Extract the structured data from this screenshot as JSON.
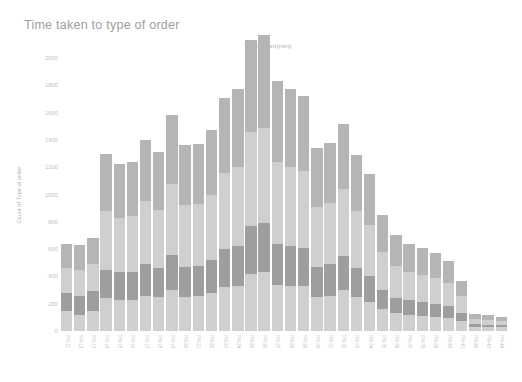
{
  "chart_data": {
    "type": "bar",
    "title": "Time taken to type of order",
    "subtitle": "Time taken(min)",
    "xlabel": "Time taken(min)",
    "ylabel": "Count of Type of order",
    "ylim": [
      0,
      2000
    ],
    "yticks": [
      "0",
      "200",
      "400",
      "600",
      "800",
      "1000",
      "1200",
      "1400",
      "1600",
      "1800",
      "2000"
    ],
    "ytick_values": [
      0,
      200,
      400,
      600,
      800,
      1000,
      1200,
      1400,
      1600,
      1800,
      2000
    ],
    "grid": false,
    "legend": "none",
    "stacked": true,
    "orientation": "vertical",
    "colors": {
      "segment_1": "#cfcfcf",
      "segment_2": "#9e9e9e",
      "segment_3": "#cfcfcf",
      "segment_4": "#b5b5b5",
      "title": "#9e9e9e",
      "tick_label": "#bdbdbd",
      "background": "#ffffff"
    },
    "series": [
      {
        "name": "segment_1",
        "values": [
          150,
          120,
          150,
          240,
          230,
          230,
          260,
          250,
          300,
          250,
          260,
          280,
          320,
          330,
          420,
          430,
          340,
          330,
          330,
          250,
          260,
          300,
          250,
          210,
          160,
          130,
          120,
          110,
          105,
          95,
          75,
          30,
          28,
          26
        ]
      },
      {
        "name": "segment_2",
        "values": [
          130,
          140,
          140,
          210,
          200,
          200,
          230,
          210,
          260,
          220,
          220,
          240,
          280,
          290,
          350,
          360,
          300,
          290,
          280,
          220,
          230,
          250,
          210,
          190,
          140,
          115,
          105,
          100,
          95,
          85,
          60,
          20,
          18,
          16
        ]
      },
      {
        "name": "segment_3",
        "values": [
          180,
          190,
          200,
          430,
          400,
          410,
          460,
          430,
          520,
          450,
          450,
          480,
          560,
          580,
          690,
          700,
          600,
          580,
          560,
          440,
          450,
          490,
          420,
          380,
          280,
          230,
          210,
          200,
          190,
          170,
          120,
          40,
          36,
          32
        ]
      },
      {
        "name": "segment_4",
        "values": [
          180,
          180,
          190,
          420,
          390,
          400,
          450,
          420,
          500,
          440,
          440,
          470,
          550,
          570,
          670,
          680,
          590,
          570,
          550,
          430,
          440,
          480,
          410,
          370,
          270,
          225,
          205,
          195,
          185,
          165,
          115,
          38,
          34,
          30
        ]
      }
    ],
    "categories": [
      "PN-11",
      "PN-12",
      "PN-13",
      "PN-14",
      "PN-15",
      "PN-16",
      "PN-17",
      "PN-18",
      "PN-19",
      "PN-20",
      "PN-21",
      "PN-22",
      "PN-23",
      "PN-24",
      "PN-25",
      "PN-26",
      "PN-27",
      "PN-28",
      "PN-29",
      "PN-30",
      "PN-31",
      "PN-32",
      "PN-33",
      "PN-34",
      "PN-35",
      "PN-36",
      "PN-37",
      "PN-38",
      "PN-39",
      "PN-40",
      "PN-41",
      "PN-42",
      "PN-43",
      "PN-44"
    ],
    "totals": [
      640,
      630,
      680,
      1300,
      1220,
      1240,
      1400,
      1310,
      1580,
      1360,
      1370,
      1470,
      1710,
      1770,
      2130,
      2170,
      1830,
      1770,
      1720,
      1340,
      1380,
      1520,
      1290,
      1150,
      850,
      700,
      640,
      605,
      575,
      515,
      370,
      128,
      116,
      104
    ]
  }
}
